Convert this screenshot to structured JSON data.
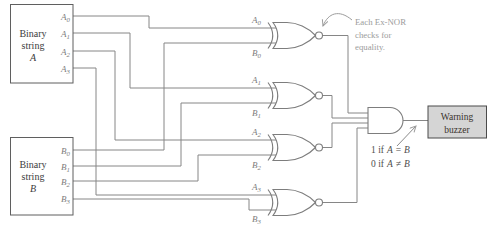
{
  "colors": {
    "wire": "#868686",
    "gate_stroke": "#7d7d7d",
    "box_border": "#5f5f5f",
    "box_text": "#3c3c3c",
    "pin_text": "#7c7c7c",
    "annotation_text": "#9c9c9c",
    "note_text": "#4e4e4e",
    "buzzer_fill": "#d5d5d5",
    "buzzer_border": "#4a4a4a",
    "buzzer_text": "#3a332d"
  },
  "box_a": {
    "line1": "Binary",
    "line2": "string",
    "letter": "A"
  },
  "box_b": {
    "line1": "Binary",
    "line2": "string",
    "letter": "B"
  },
  "pins_a": [
    {
      "letter": "A",
      "sub": "0"
    },
    {
      "letter": "A",
      "sub": "1"
    },
    {
      "letter": "A",
      "sub": "2"
    },
    {
      "letter": "A",
      "sub": "3"
    }
  ],
  "pins_b": [
    {
      "letter": "B",
      "sub": "0"
    },
    {
      "letter": "B",
      "sub": "1"
    },
    {
      "letter": "B",
      "sub": "2"
    },
    {
      "letter": "B",
      "sub": "3"
    }
  ],
  "annotation": {
    "line1": "Each Ex-NOR",
    "line2": "checks for",
    "line3": "equality."
  },
  "note": {
    "line1": {
      "prefix": "1 if",
      "lhs": "A",
      "op": "=",
      "rhs": "B"
    },
    "line2": {
      "prefix": "0 if",
      "lhs": "A",
      "op": "≠",
      "rhs": "B"
    }
  },
  "buzzer": {
    "line1": "Warning",
    "line2": "buzzer"
  }
}
